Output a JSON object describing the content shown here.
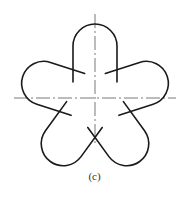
{
  "figure": {
    "caption": "(c)",
    "lobes": 5,
    "stroke_color": "#1a1a1a",
    "centerline_color": "#555555"
  }
}
